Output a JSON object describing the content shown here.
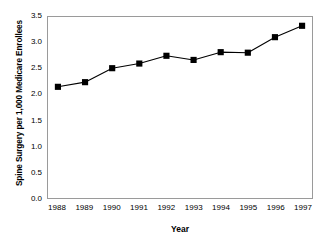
{
  "chart_data": {
    "type": "line",
    "title": "",
    "xlabel": "Year",
    "ylabel": "Spine Surgery per 1,000 Medicare Enrollees",
    "categories": [
      "1988",
      "1989",
      "1990",
      "1991",
      "1992",
      "1993",
      "1994",
      "1995",
      "1996",
      "1997"
    ],
    "x": [
      1988,
      1989,
      1990,
      1991,
      1992,
      1993,
      1994,
      1995,
      1996,
      1997
    ],
    "values": [
      2.15,
      2.24,
      2.51,
      2.6,
      2.75,
      2.67,
      2.82,
      2.81,
      3.11,
      3.33
    ],
    "series": [
      {
        "name": "Spine Surgery Rate",
        "values": [
          2.15,
          2.24,
          2.51,
          2.6,
          2.75,
          2.67,
          2.82,
          2.81,
          3.11,
          3.33
        ]
      }
    ],
    "ylim": [
      0.0,
      3.5
    ],
    "yticks": [
      "0.0",
      "0.5",
      "1.0",
      "1.5",
      "2.0",
      "2.5",
      "3.0",
      "3.5"
    ],
    "ytick_values": [
      0.0,
      0.5,
      1.0,
      1.5,
      2.0,
      2.5,
      3.0,
      3.5
    ],
    "xtick_labels": [
      "1988",
      "1989",
      "1990",
      "1991",
      "1992",
      "1993",
      "1994",
      "1995",
      "1996",
      "1997"
    ],
    "grid": false,
    "legend": "none",
    "marker": "square",
    "line_color": "#000000",
    "marker_color": "#000000",
    "frame_color": "#9a9a9a",
    "background": "#ffffff"
  }
}
